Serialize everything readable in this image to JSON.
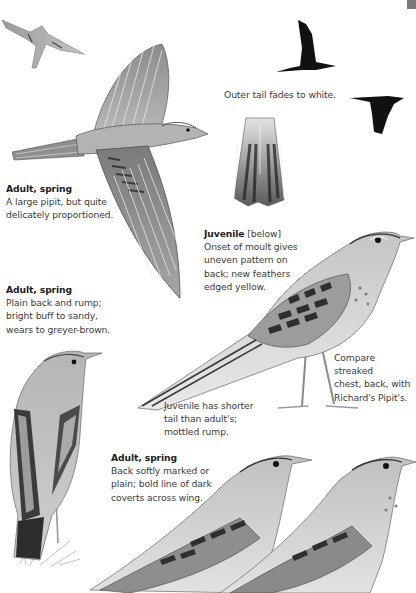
{
  "page": {
    "background": "#ffffff",
    "corner_mark_color": "#7a7a7a"
  },
  "captions": [
    {
      "id": "adult-flight",
      "title": "Adult, spring",
      "text": [
        "A large pipit, but quite",
        "delicately proportioned."
      ]
    },
    {
      "id": "adult-plain",
      "title": "Adult, spring",
      "text": [
        "Plain back and rump;",
        "bright buff to sandy,",
        "wears to greyer-brown."
      ]
    },
    {
      "id": "juvenile",
      "title": "Juvenile",
      "title_note": " [below]",
      "text": [
        "Onset of moult gives",
        "uneven pattern on",
        "back; new feathers",
        "edged yellow."
      ]
    },
    {
      "id": "outer-tail",
      "text": [
        "Outer tail fades to white."
      ]
    },
    {
      "id": "compare",
      "text": [
        "Compare streaked",
        "chest, back, with",
        "Richard's Pipit's."
      ]
    },
    {
      "id": "juvenile-tail",
      "text": [
        "Juvenile has shorter",
        "tail than adult's;",
        "mottled rump."
      ]
    },
    {
      "id": "adult-wing",
      "title": "Adult, spring",
      "text": [
        "Back softly marked or",
        "plain; bold line of dark",
        "coverts across wing."
      ]
    }
  ],
  "illustrations": [
    {
      "id": "small-flight-pipit",
      "label": "Pipit in flight from below (small)"
    },
    {
      "id": "large-flight-pipit",
      "label": "Adult spring pipit in flight, wings spread"
    },
    {
      "id": "silhouette-upstroke",
      "label": "Flight silhouette, wings raised"
    },
    {
      "id": "silhouette-downstroke",
      "label": "Flight silhouette, wings lowered"
    },
    {
      "id": "tail-detail",
      "label": "Spread tail feathers detail"
    },
    {
      "id": "juvenile-standing",
      "label": "Juvenile pipit standing"
    },
    {
      "id": "adult-rear-view",
      "label": "Adult pipit perched, rear view on grass"
    },
    {
      "id": "adult-head-1",
      "label": "Adult pipit head and wing"
    },
    {
      "id": "adult-head-2",
      "label": "Adult pipit head and wing"
    }
  ]
}
